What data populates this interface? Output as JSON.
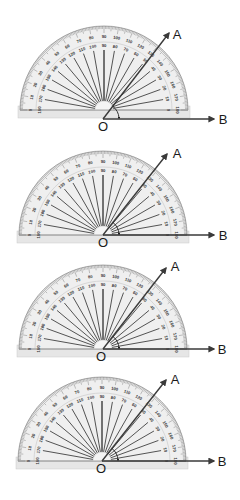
{
  "diagram": {
    "colors": {
      "protractor_fill": "#e6e6e6",
      "protractor_edge": "#9a9a9a",
      "tick": "#555555",
      "ray": "#3a3a3a",
      "radial_line": "#2b2b2b",
      "text": "#1a1a1a"
    },
    "scale": {
      "outer_labels": [
        "0",
        "10",
        "20",
        "30",
        "40",
        "50",
        "60",
        "70",
        "80",
        "90",
        "100",
        "110",
        "120",
        "130",
        "140",
        "150",
        "160",
        "170",
        "180"
      ],
      "inner_labels": [
        "180",
        "170",
        "160",
        "150",
        "140",
        "130",
        "120",
        "110",
        "100",
        "90",
        "80",
        "70",
        "60",
        "50",
        "40",
        "30",
        "20",
        "10",
        "0"
      ]
    },
    "panels": [
      {
        "id": "panel-1",
        "center": [
          104,
          110
        ],
        "radius": 84,
        "vertex": [
          103,
          119
        ],
        "vertex_label": "O",
        "vertex_label_pos": [
          103,
          131
        ],
        "ray_a_end": [
          169,
          33
        ],
        "ray_a_label": "A",
        "ray_a_label_pos": [
          177,
          39
        ],
        "ray_b_end": [
          214,
          119
        ],
        "ray_b_label": "B",
        "ray_b_label_pos": [
          223,
          124
        ],
        "misaligned": true
      },
      {
        "id": "panel-2",
        "center": [
          103,
          235
        ],
        "radius": 84,
        "vertex": [
          103,
          235
        ],
        "vertex_label": "O",
        "vertex_label_pos": [
          103,
          247
        ],
        "ray_a_end": [
          167,
          154
        ],
        "ray_a_label": "A",
        "ray_a_label_pos": [
          177,
          158
        ],
        "ray_b_end": [
          214,
          235
        ],
        "ray_b_label": "B",
        "ray_b_label_pos": [
          223,
          240
        ],
        "misaligned": false
      },
      {
        "id": "panel-3",
        "center": [
          103,
          349
        ],
        "radius": 84,
        "vertex": [
          103,
          349
        ],
        "vertex_label": "O",
        "vertex_label_pos": [
          101,
          361
        ],
        "ray_a_end": [
          166,
          268
        ],
        "ray_a_label": "A",
        "ray_a_label_pos": [
          175,
          271
        ],
        "ray_b_end": [
          214,
          349
        ],
        "ray_b_label": "B",
        "ray_b_label_pos": [
          222,
          354
        ],
        "misaligned": false
      },
      {
        "id": "panel-4",
        "center": [
          102,
          461
        ],
        "radius": 84,
        "vertex": [
          102,
          461
        ],
        "vertex_label": "O",
        "vertex_label_pos": [
          101,
          473
        ],
        "ray_a_end": [
          166,
          380
        ],
        "ray_a_label": "A",
        "ray_a_label_pos": [
          175,
          384
        ],
        "ray_b_end": [
          214,
          461
        ],
        "ray_b_label": "B",
        "ray_b_label_pos": [
          222,
          466
        ],
        "misaligned": false
      }
    ]
  }
}
